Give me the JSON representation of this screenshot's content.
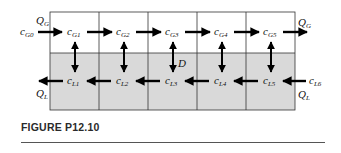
{
  "figure": {
    "caption": "FIGURE P12.10",
    "colors": {
      "gas_phase_fill": "#ffffff",
      "liquid_phase_fill": "#d9d9d9",
      "grid_line": "#333333",
      "arrow": "#000000"
    },
    "stages": 5,
    "gas_inlet": {
      "label": "c",
      "sub": "G0"
    },
    "gas_outlet_flow": {
      "label": "Q",
      "sub": "G"
    },
    "gas_inlet_flow": {
      "label": "Q",
      "sub": "G"
    },
    "liquid_inlet": {
      "label": "c",
      "sub": "L6"
    },
    "liquid_inlet_flow": {
      "label": "Q",
      "sub": "L"
    },
    "liquid_outlet_flow": {
      "label": "Q",
      "sub": "L"
    },
    "diffusion_label": "D",
    "gas_cells": [
      {
        "label": "c",
        "sub": "G1"
      },
      {
        "label": "c",
        "sub": "G2"
      },
      {
        "label": "c",
        "sub": "G3"
      },
      {
        "label": "c",
        "sub": "G4"
      },
      {
        "label": "c",
        "sub": "G5"
      }
    ],
    "liquid_cells": [
      {
        "label": "c",
        "sub": "L1"
      },
      {
        "label": "c",
        "sub": "L2"
      },
      {
        "label": "c",
        "sub": "L3"
      },
      {
        "label": "c",
        "sub": "L4"
      },
      {
        "label": "c",
        "sub": "L5"
      }
    ]
  }
}
